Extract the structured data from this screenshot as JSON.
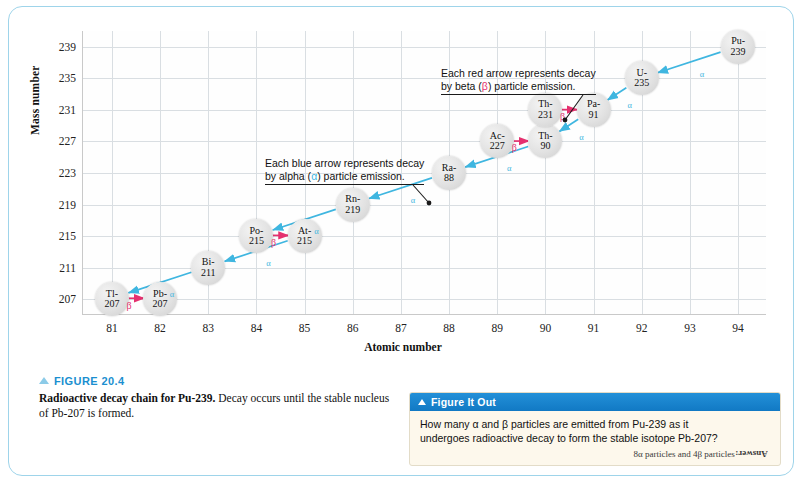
{
  "chart_data": {
    "type": "scatter",
    "title": "Radioactive decay chain for Pu-239",
    "xlabel": "Atomic number",
    "ylabel": "Mass number",
    "xlim": [
      80.4,
      94.6
    ],
    "ylim": [
      205,
      241
    ],
    "xticks": [
      81,
      82,
      83,
      84,
      85,
      86,
      87,
      88,
      89,
      90,
      91,
      92,
      93,
      94
    ],
    "yticks": [
      207,
      211,
      215,
      219,
      223,
      227,
      231,
      235,
      239
    ],
    "grid": true,
    "legend": "none",
    "nodes": [
      {
        "label_top": "Tl-",
        "label_bottom": "207",
        "x": 81,
        "y": 207
      },
      {
        "label_top": "Pb-",
        "label_bottom": "207",
        "x": 82,
        "y": 207
      },
      {
        "label_top": "Bi-",
        "label_bottom": "211",
        "x": 83,
        "y": 211
      },
      {
        "label_top": "Po-",
        "label_bottom": "215",
        "x": 84,
        "y": 215
      },
      {
        "label_top": "At-",
        "label_bottom": "215",
        "x": 85,
        "y": 215
      },
      {
        "label_top": "Rn-",
        "label_bottom": "219",
        "x": 86,
        "y": 219
      },
      {
        "label_top": "Ra-",
        "label_bottom": "88",
        "x": 88,
        "y": 223
      },
      {
        "label_top": "Ac-",
        "label_bottom": "227",
        "x": 89,
        "y": 227
      },
      {
        "label_top": "Th-",
        "label_bottom": "90",
        "x": 90,
        "y": 227
      },
      {
        "label_top": "Th-",
        "label_bottom": "231",
        "x": 90,
        "y": 231
      },
      {
        "label_top": "Pa-",
        "label_bottom": "91",
        "x": 91,
        "y": 231
      },
      {
        "label_top": "U-",
        "label_bottom": "235",
        "x": 92,
        "y": 235
      },
      {
        "label_top": "Pu-",
        "label_bottom": "239",
        "x": 94,
        "y": 239
      }
    ],
    "alpha_arrows": [
      {
        "from": [
          94,
          239
        ],
        "to": [
          92,
          235
        ],
        "label": "α"
      },
      {
        "from": [
          92,
          235
        ],
        "to": [
          91,
          231
        ],
        "label": "α"
      },
      {
        "from": [
          91,
          231
        ],
        "to": [
          90,
          227
        ],
        "label": "α"
      },
      {
        "from": [
          90,
          227
        ],
        "to": [
          88,
          223
        ],
        "label": "α"
      },
      {
        "from": [
          88,
          223
        ],
        "to": [
          86,
          219
        ],
        "label": "α"
      },
      {
        "from": [
          86,
          219
        ],
        "to": [
          84,
          215
        ],
        "label": "α"
      },
      {
        "from": [
          85,
          215
        ],
        "to": [
          83,
          211
        ],
        "label": "α"
      },
      {
        "from": [
          83,
          211
        ],
        "to": [
          81,
          207
        ],
        "label": "α"
      }
    ],
    "beta_arrows": [
      {
        "from": [
          81,
          207
        ],
        "to": [
          82,
          207
        ],
        "label": "β"
      },
      {
        "from": [
          84,
          215
        ],
        "to": [
          85,
          215
        ],
        "label": "β"
      },
      {
        "from": [
          89,
          227
        ],
        "to": [
          90,
          227
        ],
        "label": "β"
      },
      {
        "from": [
          90,
          231
        ],
        "to": [
          91,
          231
        ],
        "label": "β"
      }
    ],
    "annotations": [
      {
        "name": "alpha-callout",
        "line1": "Each blue arrow represents decay",
        "line2_pre": "by alpha (",
        "line2_tok": "α",
        "line2_post": ") particle emission.",
        "token_color": "#3fb6e0"
      },
      {
        "name": "beta-callout",
        "line1": "Each red arrow represents decay",
        "line2_pre": "by beta (",
        "line2_tok": "β",
        "line2_post": ") particle emission.",
        "token_color": "#e5316f"
      }
    ]
  },
  "caption": {
    "figure_number": "FIGURE 20.4",
    "title": "Radioactive decay chain for Pu-239.",
    "body": "Decay occurs until the stable nucleus of Pb-207 is formed."
  },
  "figure_it_out": {
    "header": "Figure It Out",
    "question_line1": "How many α and β particles are emitted from Pu-239 as it",
    "question_line2": "undergoes radioactive decay to form the stable isotope Pb-207?",
    "answer_label": "Answer:",
    "answer_text": " 8α particles and 4β particles"
  },
  "colors": {
    "alpha_arrow": "#3fb6e0",
    "beta_arrow": "#e5316f",
    "panel_border": "#9ed4ea",
    "caption_heading": "#1b8fd0",
    "fio_header_bg": "#1179c4",
    "fio_body_bg": "#fdf8ec",
    "grid_line": "#d9dee2"
  }
}
